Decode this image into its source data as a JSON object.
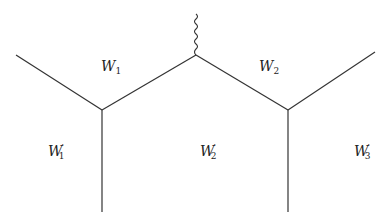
{
  "diagram": {
    "type": "feynman-like-graph",
    "stroke_color": "#333333",
    "background": "#ffffff",
    "regions": [
      {
        "id": "W1",
        "base": "W",
        "sub": "1",
        "prime": "",
        "x": 101,
        "y": 66
      },
      {
        "id": "W2",
        "base": "W",
        "sub": "2",
        "prime": "",
        "x": 260,
        "y": 66
      },
      {
        "id": "W1p",
        "base": "W",
        "sub": "1",
        "prime": "′",
        "x": 48,
        "y": 150
      },
      {
        "id": "W2p",
        "base": "W",
        "sub": "2",
        "prime": "′",
        "x": 200,
        "y": 150
      },
      {
        "id": "W3p",
        "base": "W",
        "sub": "3",
        "prime": "′",
        "x": 354,
        "y": 150
      }
    ],
    "vertices": {
      "top_center": [
        196,
        55
      ],
      "left": [
        102,
        110
      ],
      "right": [
        288,
        110
      ]
    },
    "edges": [
      {
        "from": [
          16,
          55
        ],
        "to": [
          102,
          110
        ]
      },
      {
        "from": [
          102,
          110
        ],
        "to": [
          196,
          55
        ]
      },
      {
        "from": [
          196,
          55
        ],
        "to": [
          288,
          110
        ]
      },
      {
        "from": [
          288,
          110
        ],
        "to": [
          375,
          52
        ]
      },
      {
        "from": [
          102,
          110
        ],
        "to": [
          102,
          212
        ]
      },
      {
        "from": [
          288,
          110
        ],
        "to": [
          288,
          212
        ]
      }
    ],
    "wavy_edge": {
      "from": [
        196,
        14
      ],
      "to": [
        196,
        55
      ]
    }
  }
}
